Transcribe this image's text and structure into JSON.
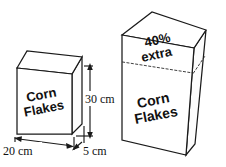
{
  "figure": {
    "background_color": "#ffffff",
    "stroke_color": "#1a1a1a",
    "text_color": "#111111"
  },
  "small_box": {
    "brand_line1": "Corn",
    "brand_line2": "Flakes",
    "dimensions": {
      "width_label": "20 cm",
      "depth_label": "5 cm",
      "height_label": "30 cm"
    }
  },
  "large_box": {
    "brand_line1": "Corn",
    "brand_line2": "Flakes",
    "promo_line1": "40%",
    "promo_line2": "extra"
  }
}
